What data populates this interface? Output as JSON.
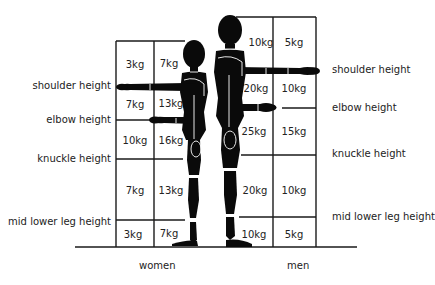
{
  "diagram": {
    "title": "",
    "groups": [
      {
        "name": "women",
        "label": "women",
        "columns": [
          "inner",
          "outer"
        ],
        "zones": [
          {
            "zone": "shoulder-to-head",
            "close": "7kg",
            "far": "3kg"
          },
          {
            "zone": "elbow-to-shoulder",
            "close": "13kg",
            "far": "7kg"
          },
          {
            "zone": "knuckle-to-elbow",
            "close": "16kg",
            "far": "10kg"
          },
          {
            "zone": "mid-lower-leg-to-knuckle",
            "close": "13kg",
            "far": "7kg"
          },
          {
            "zone": "floor-to-mid-lower-leg",
            "close": "7kg",
            "far": "3kg"
          }
        ]
      },
      {
        "name": "men",
        "label": "men",
        "columns": [
          "inner",
          "outer"
        ],
        "zones": [
          {
            "zone": "shoulder-to-head",
            "close": "10kg",
            "far": "5kg"
          },
          {
            "zone": "elbow-to-shoulder",
            "close": "20kg",
            "far": "10kg"
          },
          {
            "zone": "knuckle-to-elbow",
            "close": "25kg",
            "far": "15kg"
          },
          {
            "zone": "mid-lower-leg-to-knuckle",
            "close": "20kg",
            "far": "10kg"
          },
          {
            "zone": "floor-to-mid-lower-leg",
            "close": "10kg",
            "far": "5kg"
          }
        ]
      }
    ],
    "left_labels": {
      "shoulder": "shoulder height",
      "elbow": "elbow height",
      "knuckle": "knuckle height",
      "mid_lower_leg": "mid lower leg height"
    },
    "right_labels": {
      "shoulder": "shoulder height",
      "elbow": "elbow height",
      "knuckle": "knuckle height",
      "mid_lower_leg": "mid lower leg height"
    },
    "group_labels": {
      "women": "women",
      "men": "men"
    },
    "colors": {
      "line": "#1a1a1a",
      "figure": "#0a0a0a",
      "background": "#ffffff"
    }
  }
}
